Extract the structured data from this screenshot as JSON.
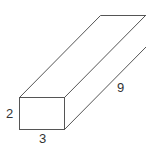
{
  "diagram": {
    "type": "rectangular-prism",
    "labels": {
      "height": "2",
      "width": "3",
      "length": "9"
    },
    "stroke_color": "#555555"
  }
}
